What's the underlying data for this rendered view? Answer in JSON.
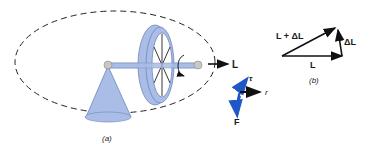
{
  "panel_a": {
    "caption": "(a)",
    "output_label": "L",
    "torque_label": "τ",
    "radius_label": "r",
    "force_label": "F"
  },
  "panel_b": {
    "caption": "(b)",
    "sum_label": "L + ΔL",
    "delta_label": "ΔL",
    "base_label": "L"
  },
  "colors": {
    "body": "#a9bde6",
    "body_edge": "#6f86bd",
    "vector_blue": "#1f56c8",
    "ink": "#111111"
  }
}
